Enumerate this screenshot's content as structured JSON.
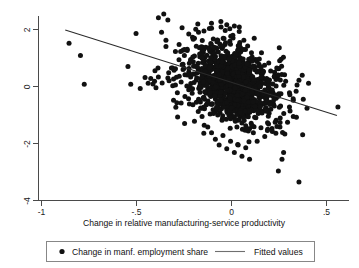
{
  "chart_data": {
    "type": "scatter",
    "title": "",
    "xlabel": "Change in relative manufacturing-service productivity",
    "ylabel": "",
    "xlim": [
      -1.05,
      0.6
    ],
    "ylim": [
      -4.6,
      2.8
    ],
    "xticks": [
      -1,
      -0.5,
      0,
      0.5
    ],
    "xticklabels": [
      "-1",
      "-.5",
      "0",
      ".5"
    ],
    "yticks": [
      2,
      0,
      -2,
      -4
    ],
    "yticklabels": [
      "2",
      "0",
      "-2",
      "-4"
    ],
    "grid": false,
    "legend_position": "bottom-outside",
    "marker_color": "#111111",
    "line_color": "#2b2b2b",
    "series": [
      {
        "name": "Change in manf. employment share",
        "type": "scatter",
        "marker": "circle",
        "points": [
          [
            -0.855,
            1.52
          ],
          [
            -0.795,
            1.09
          ],
          [
            -0.775,
            0.08
          ],
          [
            -0.545,
            0.7
          ],
          [
            -0.335,
            2.33
          ],
          [
            -0.345,
            1.62
          ],
          [
            -0.345,
            1.4
          ],
          [
            -0.225,
            1.84
          ],
          [
            -0.205,
            1.73
          ],
          [
            -0.195,
            1.69
          ],
          [
            -0.145,
            1.95
          ],
          [
            -0.105,
            2.04
          ],
          [
            -0.075,
            1.63
          ],
          [
            -0.055,
            2.09
          ],
          [
            -0.025,
            2.17
          ],
          [
            0.015,
            2.12
          ],
          [
            -0.045,
            1.4
          ],
          [
            -0.115,
            1.33
          ],
          [
            -0.155,
            1.22
          ],
          [
            -0.195,
            1.07
          ],
          [
            -0.455,
            0.32
          ],
          [
            -0.425,
            0.28
          ],
          [
            -0.405,
            0.18
          ],
          [
            -0.385,
            0.33
          ],
          [
            -0.365,
            0.12
          ],
          [
            -0.335,
            0.3
          ],
          [
            -0.305,
            0.26
          ],
          [
            -0.295,
            0.05
          ],
          [
            -0.275,
            0.36
          ],
          [
            -0.265,
            0.16
          ],
          [
            -0.255,
            0.6
          ],
          [
            -0.245,
            0.41
          ],
          [
            -0.235,
            0.02
          ],
          [
            -0.225,
            0.51
          ],
          [
            -0.215,
            0.33
          ],
          [
            -0.205,
            -0.08
          ],
          [
            -0.195,
            0.44
          ],
          [
            -0.185,
            0.23
          ],
          [
            -0.175,
            0.62
          ],
          [
            -0.165,
            0.13
          ],
          [
            -0.155,
            0.48
          ],
          [
            -0.145,
            0.05
          ],
          [
            -0.135,
            0.74
          ],
          [
            -0.125,
            0.29
          ],
          [
            -0.115,
            0.55
          ],
          [
            -0.105,
            0.11
          ],
          [
            -0.095,
            0.67
          ],
          [
            -0.085,
            0.36
          ],
          [
            -0.075,
            0.88
          ],
          [
            -0.065,
            0.21
          ],
          [
            -0.055,
            0.58
          ],
          [
            -0.045,
            0.95
          ],
          [
            -0.035,
            0.42
          ],
          [
            -0.025,
            0.73
          ],
          [
            -0.015,
            1.02
          ],
          [
            -0.005,
            0.31
          ],
          [
            0.005,
            0.64
          ],
          [
            0.015,
            0.86
          ],
          [
            0.025,
            0.39
          ],
          [
            0.035,
            0.71
          ],
          [
            0.045,
            0.25
          ],
          [
            0.055,
            0.54
          ],
          [
            0.065,
            0.12
          ],
          [
            0.075,
            0.43
          ],
          [
            0.085,
            -0.02
          ],
          [
            0.095,
            0.31
          ],
          [
            0.105,
            0.18
          ],
          [
            0.115,
            -0.15
          ],
          [
            0.125,
            0.22
          ],
          [
            0.135,
            -0.05
          ],
          [
            0.145,
            -0.28
          ],
          [
            0.155,
            0.09
          ],
          [
            0.165,
            -0.34
          ],
          [
            0.175,
            -0.12
          ],
          [
            0.185,
            -0.45
          ],
          [
            0.195,
            -0.22
          ],
          [
            0.205,
            -0.55
          ],
          [
            0.215,
            -0.33
          ],
          [
            0.225,
            -0.68
          ],
          [
            0.235,
            -0.41
          ],
          [
            -0.095,
            -0.18
          ],
          [
            -0.085,
            -0.44
          ],
          [
            -0.075,
            -0.26
          ],
          [
            -0.065,
            -0.61
          ],
          [
            -0.055,
            -0.35
          ],
          [
            -0.045,
            -0.72
          ],
          [
            -0.035,
            -0.48
          ],
          [
            -0.025,
            -0.85
          ],
          [
            -0.015,
            -0.56
          ],
          [
            -0.005,
            -0.95
          ],
          [
            0.005,
            -0.65
          ],
          [
            0.015,
            -1.08
          ],
          [
            0.025,
            -0.78
          ],
          [
            0.035,
            -1.18
          ],
          [
            0.045,
            -0.88
          ],
          [
            0.055,
            -1.28
          ],
          [
            0.065,
            -0.98
          ],
          [
            0.075,
            -1.38
          ],
          [
            0.085,
            -1.05
          ],
          [
            0.095,
            -1.48
          ],
          [
            -0.145,
            -0.72
          ],
          [
            -0.155,
            -1.05
          ],
          [
            -0.175,
            -0.88
          ],
          [
            -0.195,
            -1.22
          ],
          [
            -0.125,
            -1.42
          ],
          [
            -0.105,
            -1.62
          ],
          [
            -0.085,
            -1.85
          ],
          [
            -0.065,
            -2.05
          ],
          [
            -0.045,
            -1.72
          ],
          [
            -0.025,
            -2.18
          ],
          [
            -0.005,
            -1.92
          ],
          [
            0.015,
            -2.32
          ],
          [
            0.035,
            -2.05
          ],
          [
            0.055,
            -2.45
          ],
          [
            0.075,
            -2.15
          ],
          [
            0.095,
            -2.55
          ],
          [
            0.115,
            -1.62
          ],
          [
            0.135,
            -1.92
          ],
          [
            0.155,
            -1.45
          ],
          [
            0.175,
            -1.75
          ],
          [
            0.195,
            -1.32
          ],
          [
            0.215,
            -1.58
          ],
          [
            0.235,
            -1.18
          ],
          [
            0.255,
            -1.42
          ],
          [
            0.275,
            -0.95
          ],
          [
            0.295,
            -1.25
          ],
          [
            0.305,
            -0.72
          ],
          [
            0.325,
            -1.05
          ],
          [
            0.265,
            0.42
          ],
          [
            0.285,
            0.18
          ],
          [
            0.245,
            0.62
          ],
          [
            0.225,
            0.34
          ],
          [
            0.305,
            -0.22
          ],
          [
            0.325,
            -0.48
          ],
          [
            0.345,
            0.05
          ],
          [
            0.355,
            0.22
          ],
          [
            0.355,
            -3.35
          ],
          [
            -0.245,
            -0.35
          ],
          [
            -0.265,
            -0.58
          ],
          [
            -0.285,
            -0.22
          ],
          [
            -0.305,
            -0.48
          ],
          [
            -0.175,
            0.82
          ],
          [
            -0.215,
            0.95
          ],
          [
            -0.255,
            0.78
          ],
          [
            -0.295,
            0.62
          ],
          [
            0.105,
            1.18
          ],
          [
            0.085,
            1.42
          ],
          [
            0.065,
            1.62
          ],
          [
            0.045,
            1.32
          ],
          [
            0.125,
            0.95
          ],
          [
            0.145,
            0.72
          ],
          [
            0.165,
            0.48
          ],
          [
            0.185,
            0.28
          ]
        ]
      },
      {
        "name": "Fitted values",
        "type": "line",
        "endpoints": [
          [
            -0.875,
            1.98
          ],
          [
            0.555,
            -1.02
          ]
        ],
        "slope": -2.1,
        "intercept": 0.14
      }
    ]
  },
  "axes": {
    "x_title": "Change in relative manufacturing-service productivity",
    "x_tick_labels": [
      "-1",
      "-.5",
      "0",
      ".5"
    ],
    "y_tick_labels": [
      "2",
      "0",
      "-2",
      "-4"
    ]
  },
  "legend": {
    "entries": [
      {
        "label": "Change in manf. employment share",
        "marker": "dot"
      },
      {
        "label": "Fitted values",
        "marker": "line"
      }
    ]
  }
}
